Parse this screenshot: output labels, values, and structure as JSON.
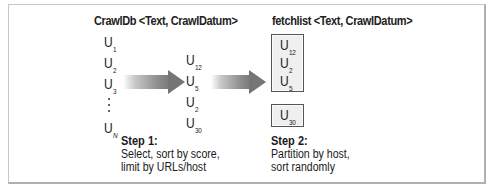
{
  "diagram": {
    "left_title": "CrawlDb <Text, CrawlDatum>",
    "right_title": "fetchlist <Text, CrawlDatum>",
    "crawldb_entries": [
      {
        "base": "U",
        "sub": "1"
      },
      {
        "base": "U",
        "sub": "2"
      },
      {
        "base": "U",
        "sub": "3"
      },
      {
        "base": "U",
        "sub": "N"
      }
    ],
    "selected_entries": [
      {
        "base": "U",
        "sub": "12"
      },
      {
        "base": "U",
        "sub": "5"
      },
      {
        "base": "U",
        "sub": "2"
      },
      {
        "base": "U",
        "sub": "30"
      }
    ],
    "partition_1": [
      {
        "base": "U",
        "sub": "12"
      },
      {
        "base": "U",
        "sub": "2"
      },
      {
        "base": "U",
        "sub": "5"
      }
    ],
    "partition_2": [
      {
        "base": "U",
        "sub": "30"
      }
    ],
    "step1": {
      "label": "Step 1:",
      "lines": [
        "Select, sort by score,",
        "limit by URLs/host"
      ]
    },
    "step2": {
      "label": "Step 2:",
      "lines": [
        "Partition by host,",
        "sort randomly"
      ]
    },
    "colors": {
      "frame": "#b0b0b0",
      "arrow": "#7a7a7a",
      "box_fill": "#efefef",
      "box_border": "#555555"
    }
  }
}
